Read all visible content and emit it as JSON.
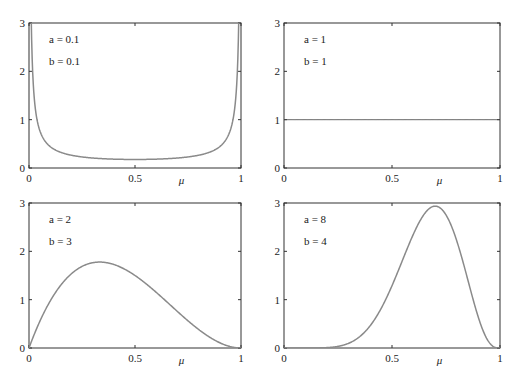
{
  "chart_data": [
    {
      "type": "line",
      "title": "",
      "xlabel": "μ",
      "ylabel": "",
      "xlim": [
        0,
        1
      ],
      "ylim": [
        0,
        3
      ],
      "xticks": [
        "0",
        "0.5",
        "1"
      ],
      "yticks": [
        "0",
        "1",
        "2",
        "3"
      ],
      "annotations": [
        "a = 0.1",
        "b = 0.1"
      ],
      "series": [
        {
          "name": "Beta(0.1,0.1)",
          "a": 0.1,
          "b": 0.1,
          "x": [
            0.005,
            0.02,
            0.05,
            0.1,
            0.2,
            0.3,
            0.5,
            0.7,
            0.8,
            0.9,
            0.95,
            0.98,
            0.995
          ],
          "y": [
            3.0,
            1.3,
            0.67,
            0.39,
            0.24,
            0.2,
            0.17,
            0.2,
            0.24,
            0.39,
            0.67,
            1.3,
            3.0
          ]
        }
      ],
      "grid": false
    },
    {
      "type": "line",
      "title": "",
      "xlabel": "μ",
      "ylabel": "",
      "xlim": [
        0,
        1
      ],
      "ylim": [
        0,
        3
      ],
      "xticks": [
        "0",
        "0.5",
        "1"
      ],
      "yticks": [
        "0",
        "1",
        "2",
        "3"
      ],
      "annotations": [
        "a = 1",
        "b = 1"
      ],
      "series": [
        {
          "name": "Beta(1,1)",
          "a": 1,
          "b": 1,
          "x": [
            0,
            1
          ],
          "y": [
            1,
            1
          ]
        }
      ],
      "grid": false
    },
    {
      "type": "line",
      "title": "",
      "xlabel": "μ",
      "ylabel": "",
      "xlim": [
        0,
        1
      ],
      "ylim": [
        0,
        3
      ],
      "xticks": [
        "0",
        "0.5",
        "1"
      ],
      "yticks": [
        "0",
        "1",
        "2",
        "3"
      ],
      "annotations": [
        "a = 2",
        "b = 3"
      ],
      "series": [
        {
          "name": "Beta(2,3)",
          "a": 2,
          "b": 3,
          "x": [
            0,
            0.1,
            0.2,
            0.333,
            0.5,
            0.6,
            0.7,
            0.8,
            0.9,
            1
          ],
          "y": [
            0,
            0.97,
            1.54,
            1.78,
            1.5,
            1.15,
            0.76,
            0.38,
            0.11,
            0
          ]
        }
      ],
      "grid": false
    },
    {
      "type": "line",
      "title": "",
      "xlabel": "μ",
      "ylabel": "",
      "xlim": [
        0,
        1
      ],
      "ylim": [
        0,
        3
      ],
      "xticks": [
        "0",
        "0.5",
        "1"
      ],
      "yticks": [
        "0",
        "1",
        "2",
        "3"
      ],
      "annotations": [
        "a = 8",
        "b = 4"
      ],
      "series": [
        {
          "name": "Beta(8,4)",
          "a": 8,
          "b": 4,
          "x": [
            0,
            0.2,
            0.3,
            0.4,
            0.5,
            0.6,
            0.7,
            0.8,
            0.9,
            1
          ],
          "y": [
            0,
            0.01,
            0.13,
            0.65,
            1.61,
            2.66,
            2.96,
            2.2,
            0.63,
            0
          ]
        }
      ],
      "grid": false
    }
  ],
  "panels": [
    {
      "a_label": "a = 0.1",
      "b_label": "b = 0.1"
    },
    {
      "a_label": "a = 1",
      "b_label": "b = 1"
    },
    {
      "a_label": "a = 2",
      "b_label": "b = 3"
    },
    {
      "a_label": "a = 8",
      "b_label": "b = 4"
    }
  ],
  "axis": {
    "xlabel": "μ",
    "xticks": [
      "0",
      "0.5",
      "1"
    ],
    "yticks": [
      "0",
      "1",
      "2",
      "3"
    ]
  },
  "colors": {
    "curve": "#8a8a8a",
    "axes": "#333333"
  }
}
